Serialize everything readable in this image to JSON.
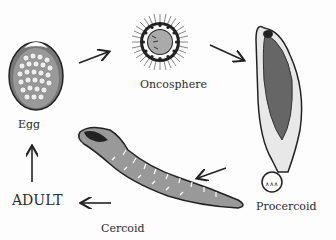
{
  "diagram": {
    "title": "",
    "type": "life-cycle",
    "stages": [
      {
        "id": "egg",
        "label": "Egg"
      },
      {
        "id": "oncosphere",
        "label": "Oncosphere"
      },
      {
        "id": "procercoid",
        "label": "Procercoid"
      },
      {
        "id": "cercoid",
        "label": "Cercoid"
      },
      {
        "id": "adult",
        "label": "ADULT"
      }
    ],
    "flow": [
      "egg",
      "oncosphere",
      "procercoid",
      "cercoid",
      "adult",
      "egg"
    ],
    "colors": {
      "ink": "#222222",
      "fill": "#9a9a9a",
      "dark": "#555555",
      "bg": "#fdfdfd"
    }
  }
}
